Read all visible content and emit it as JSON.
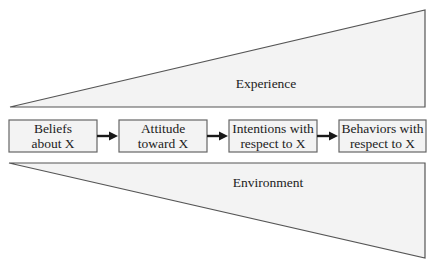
{
  "diagram": {
    "type": "flow-with-influence-wedges",
    "top_wedge": {
      "label": "Experience",
      "fill": "#f3f3f3",
      "stroke": "#555555"
    },
    "bottom_wedge": {
      "label": "Environment",
      "fill": "#f3f3f3",
      "stroke": "#555555"
    },
    "boxes": [
      {
        "line1": "Beliefs",
        "line2": "about X"
      },
      {
        "line1": "Attitude",
        "line2": "toward X"
      },
      {
        "line1": "Intentions with",
        "line2": "respect to X"
      },
      {
        "line1": "Behaviors with",
        "line2": "respect to X"
      }
    ],
    "arrows": [
      {
        "from": "Beliefs about X",
        "to": "Attitude toward X"
      },
      {
        "from": "Attitude toward X",
        "to": "Intentions with respect to X"
      },
      {
        "from": "Intentions with respect to X",
        "to": "Behaviors with respect to X"
      }
    ]
  }
}
